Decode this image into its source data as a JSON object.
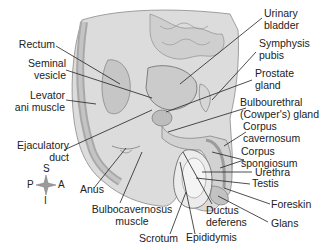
{
  "figure": {
    "type": "anatomical-diagram",
    "labels": {
      "urinary_bladder": [
        "Urinary",
        "bladder"
      ],
      "symphysis_pubis": [
        "Symphysis",
        "pubis"
      ],
      "prostate_gland": [
        "Prostate",
        "gland"
      ],
      "bulbourethral_gland": [
        "Bulbourethral",
        "(Cowper's) gland"
      ],
      "corpus_cavernosum": [
        "Corpus",
        "cavernosum"
      ],
      "corpus_spongiosum": [
        "Corpus",
        "spongiosum"
      ],
      "urethra": "Urethra",
      "testis": "Testis",
      "foreskin": "Foreskin",
      "glans": "Glans",
      "rectum": "Rectum",
      "seminal_vesicle": [
        "Seminal",
        "vesicle"
      ],
      "levator_ani_muscle": [
        "Levator",
        "ani muscle"
      ],
      "ejaculatory_duct": [
        "Ejaculatory",
        "duct"
      ],
      "anus": "Anus",
      "bulbocavernosus_muscle": [
        "Bulbocavernosus",
        "muscle"
      ],
      "scrotum": "Scrotum",
      "epididymis": "Epididymis",
      "ductus_deferens": [
        "Ductus",
        "deferens"
      ]
    },
    "compass": {
      "superior": "S",
      "inferior": "I",
      "posterior": "P",
      "anterior": "A"
    },
    "colors": {
      "tissue_light": "#e6e6e6",
      "tissue_mid": "#c8c8c8",
      "tissue_dark": "#9a9a9a",
      "leader": "#222222"
    }
  }
}
